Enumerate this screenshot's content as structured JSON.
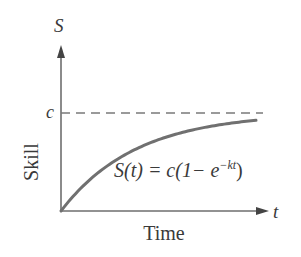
{
  "diagram": {
    "y_axis_symbol": "S",
    "x_axis_symbol": "t",
    "y_axis_label": "Skill",
    "x_axis_label": "Time",
    "asymptote_label": "c",
    "equation": {
      "lhs": "S(t) = c(1− e",
      "exponent": "−kt",
      "close": ")"
    },
    "curve": {
      "function": "S(t) = c(1 - e^(-kt))",
      "c": 1,
      "k": 2.6,
      "t_range": [
        0,
        1
      ]
    },
    "colors": {
      "axis": "#6e6e6e",
      "curve": "#707070",
      "dashed": "#7a7a7a",
      "text": "#3a3a3a"
    }
  }
}
